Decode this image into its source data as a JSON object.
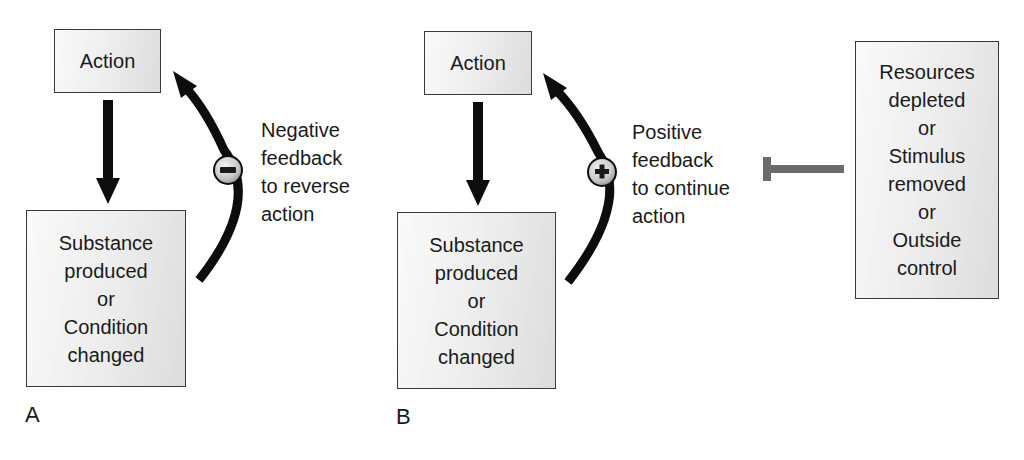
{
  "panels": {
    "A": {
      "letter": "A",
      "action_box": "Action",
      "result_box": {
        "lines": [
          "Substance",
          "produced",
          "or",
          "Condition",
          "changed"
        ]
      },
      "feedback_sign": "minus",
      "feedback_label": {
        "lines": [
          "Negative",
          "feedback",
          "to reverse",
          "action"
        ]
      }
    },
    "B": {
      "letter": "B",
      "action_box": "Action",
      "result_box": {
        "lines": [
          "Substance",
          "produced",
          "or",
          "Condition",
          "changed"
        ]
      },
      "feedback_sign": "plus",
      "feedback_label": {
        "lines": [
          "Positive",
          "feedback",
          "to continue",
          "action"
        ]
      },
      "inhibitor_box": {
        "lines": [
          "Resources",
          "depleted",
          "or",
          "Stimulus",
          "removed",
          "or",
          "Outside",
          "control"
        ]
      }
    }
  },
  "colors": {
    "arrow": "#0d0d0d",
    "inhibitor_bar": "#6b6b6b",
    "box_border": "#3a3a3a"
  }
}
